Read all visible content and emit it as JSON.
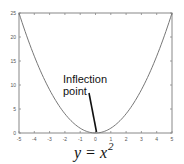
{
  "chart_data": {
    "type": "line",
    "title": "",
    "xlabel": "",
    "ylabel": "",
    "xlim": [
      -5,
      5
    ],
    "ylim": [
      0,
      25
    ],
    "grid": false,
    "x_ticks": [
      -5,
      -4,
      -3,
      -2,
      -1,
      0,
      1,
      2,
      3,
      4,
      5
    ],
    "y_ticks": [
      0,
      5,
      10,
      15,
      20,
      25
    ],
    "x_tick_labels": [
      "-5",
      "-4",
      "-3",
      "-2",
      "-1",
      "0",
      "1",
      "2",
      "3",
      "4",
      "5"
    ],
    "y_tick_labels": [
      "0",
      "5",
      "10",
      "15",
      "20",
      "25"
    ],
    "series": [
      {
        "name": "y = x^2",
        "function": "x^2",
        "x": [
          -5,
          -4.5,
          -4,
          -3.5,
          -3,
          -2.5,
          -2,
          -1.5,
          -1,
          -0.5,
          0,
          0.5,
          1,
          1.5,
          2,
          2.5,
          3,
          3.5,
          4,
          4.5,
          5
        ],
        "values": [
          25,
          20.25,
          16,
          12.25,
          9,
          6.25,
          4,
          2.25,
          1,
          0.25,
          0,
          0.25,
          1,
          2.25,
          4,
          6.25,
          9,
          12.25,
          16,
          20.25,
          25
        ],
        "color": "#777777"
      }
    ],
    "annotations": [
      {
        "text_line1": "Inflection",
        "text_line2": "point",
        "points_to": [
          0,
          0
        ]
      }
    ],
    "caption": {
      "base": "y = x",
      "superscript": "2"
    }
  }
}
